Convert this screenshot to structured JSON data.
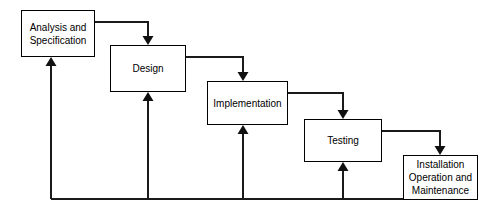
{
  "diagram": {
    "type": "waterfall-model-flowchart",
    "canvas": {
      "width": 497,
      "height": 214,
      "background": "#ffffff"
    },
    "line_color": "#1a1a1a",
    "box_border_color": "#000000",
    "box_fill_color": "#ffffff",
    "text_color": "#000000",
    "phases": [
      {
        "id": "analysis",
        "label": "Analysis and\nSpecification",
        "x": 21,
        "y": 10,
        "w": 74,
        "h": 47
      },
      {
        "id": "design",
        "label": "Design",
        "x": 110,
        "y": 45,
        "w": 76,
        "h": 47
      },
      {
        "id": "implementation",
        "label": "Implementation",
        "x": 207,
        "y": 81,
        "w": 81,
        "h": 44
      },
      {
        "id": "testing",
        "label": "Testing",
        "x": 304,
        "y": 119,
        "w": 78,
        "h": 43
      },
      {
        "id": "installation",
        "label": "Installation\nOperation and\nMaintenance",
        "x": 403,
        "y": 155,
        "w": 75,
        "h": 45
      }
    ],
    "forward_connectors": [
      {
        "id": "analysis-to-design",
        "from": "analysis",
        "to": "design",
        "exit_x": 95,
        "exit_y": 22,
        "drop_x": 148,
        "enter_y": 45
      },
      {
        "id": "design-to-implementation",
        "from": "design",
        "to": "implementation",
        "exit_x": 186,
        "exit_y": 57,
        "drop_x": 243,
        "enter_y": 81
      },
      {
        "id": "implementation-to-testing",
        "from": "implementation",
        "to": "testing",
        "exit_x": 288,
        "exit_y": 93,
        "drop_x": 343,
        "enter_y": 119
      },
      {
        "id": "testing-to-installation",
        "from": "testing",
        "to": "installation",
        "exit_x": 382,
        "exit_y": 131,
        "drop_x": 440,
        "enter_y": 155
      }
    ],
    "feedback_bus": {
      "id": "feedback-bus-line",
      "y": 199,
      "x_start": 51,
      "x_end": 403,
      "source_phase": "installation"
    },
    "feedback_arrows": [
      {
        "id": "feedback-to-analysis",
        "to": "analysis",
        "x": 51,
        "tip_y": 57
      },
      {
        "id": "feedback-to-design",
        "to": "design",
        "x": 148,
        "tip_y": 92
      },
      {
        "id": "feedback-to-implementation",
        "to": "implementation",
        "x": 243,
        "tip_y": 125
      },
      {
        "id": "feedback-to-testing",
        "to": "testing",
        "x": 343,
        "tip_y": 162
      }
    ]
  }
}
